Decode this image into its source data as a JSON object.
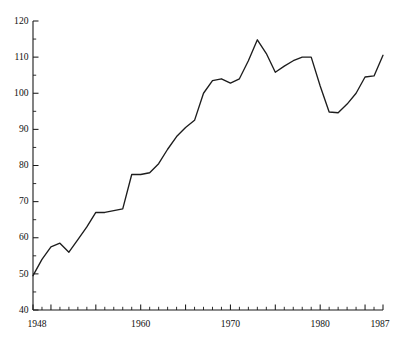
{
  "chart_data": {
    "type": "line",
    "title": "",
    "subtitle": "",
    "xlabel": "",
    "ylabel": "",
    "xlim": [
      1948,
      1987
    ],
    "ylim": [
      40,
      120
    ],
    "grid": false,
    "legend": "none",
    "y_ticks_major": [
      40,
      50,
      60,
      70,
      80,
      90,
      100,
      110,
      120
    ],
    "y_tick_labels": [
      "40",
      "50",
      "60",
      "70",
      "80",
      "90",
      "100",
      "110",
      "120"
    ],
    "y_minor_tick_step": 5,
    "x_ticks_major": [
      1950,
      1955,
      1960,
      1965,
      1970,
      1975,
      1980,
      1985
    ],
    "x_minor_tick_step": 1,
    "x_tick_labels_shown": [
      "1948",
      "1960",
      "1970",
      "1980",
      "1987"
    ],
    "x_tick_label_positions": [
      1948,
      1960,
      1970,
      1980,
      1987
    ],
    "x": [
      1948,
      1949,
      1950,
      1951,
      1952,
      1953,
      1954,
      1955,
      1956,
      1957,
      1958,
      1959,
      1960,
      1961,
      1962,
      1963,
      1964,
      1965,
      1966,
      1967,
      1968,
      1969,
      1970,
      1971,
      1972,
      1973,
      1974,
      1975,
      1976,
      1977,
      1978,
      1979,
      1980,
      1981,
      1982,
      1983,
      1984,
      1985,
      1986,
      1987
    ],
    "values": [
      49.5,
      54.0,
      57.5,
      58.5,
      56.0,
      59.5,
      63.0,
      67.0,
      67.0,
      67.5,
      68.0,
      77.5,
      77.5,
      78.0,
      80.5,
      84.5,
      88.0,
      90.5,
      92.5,
      100.0,
      103.5,
      104.0,
      102.8,
      104.0,
      109.0,
      114.8,
      111.0,
      105.8,
      107.5,
      109.0,
      110.0,
      110.0,
      102.0,
      94.8,
      94.6,
      97.0,
      100.0,
      104.5,
      104.8,
      110.5
    ],
    "series": [
      {
        "name": "series-1",
        "color": "#1d1d1d",
        "values": [
          49.5,
          54.0,
          57.5,
          58.5,
          56.0,
          59.5,
          63.0,
          67.0,
          67.0,
          67.5,
          68.0,
          77.5,
          77.5,
          78.0,
          80.5,
          84.5,
          88.0,
          90.5,
          92.5,
          100.0,
          103.5,
          104.0,
          102.8,
          104.0,
          109.0,
          114.8,
          111.0,
          105.8,
          107.5,
          109.0,
          110.0,
          110.0,
          102.0,
          94.8,
          94.6,
          97.0,
          100.0,
          104.5,
          104.8,
          110.5
        ]
      }
    ],
    "annotations": [],
    "notable_points": {
      "start": {
        "x": 1948,
        "y": 49.5
      },
      "peak": {
        "x": 1973,
        "y": 114.8
      },
      "trough_after_peak": {
        "x": 1982,
        "y": 94.6
      },
      "end": {
        "x": 1987,
        "y": 110.5
      }
    }
  },
  "colors": {
    "line": "#1d1d1d",
    "axis": "#1a1a1a",
    "background": "#ffffff",
    "text": "#111111"
  }
}
